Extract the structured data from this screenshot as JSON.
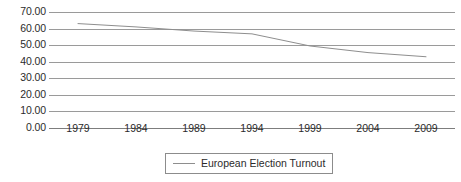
{
  "chart_data": {
    "type": "line",
    "title": "",
    "xlabel": "",
    "ylabel": "",
    "categories": [
      "1979",
      "1984",
      "1989",
      "1994",
      "1999",
      "2004",
      "2009"
    ],
    "x": [
      1979,
      1984,
      1989,
      1994,
      1999,
      2004,
      2009
    ],
    "series": [
      {
        "name": "European Election Turnout",
        "values": [
          63.0,
          61.0,
          58.5,
          56.8,
          49.5,
          45.5,
          43.0
        ],
        "color": "#8e8e8e"
      }
    ],
    "ylim": [
      0.0,
      70.0
    ],
    "ytick_labels": [
      "70.00",
      "60.00",
      "50.00",
      "40.00",
      "30.00",
      "20.00",
      "10.00",
      "0.00"
    ],
    "ytick_values": [
      70,
      60,
      50,
      40,
      30,
      20,
      10,
      0
    ],
    "grid": true,
    "legend_position": "bottom-center"
  },
  "legend": {
    "entries": [
      {
        "label": "European Election Turnout",
        "swatch": "line-swatch"
      }
    ]
  },
  "colors": {
    "series_line": "#8e8e8e",
    "gridline": "#9a9a9a",
    "axis": "#7d7d7d",
    "text": "#2b2b2b",
    "background": "#ffffff",
    "legend_border": "#8c8c8c"
  }
}
